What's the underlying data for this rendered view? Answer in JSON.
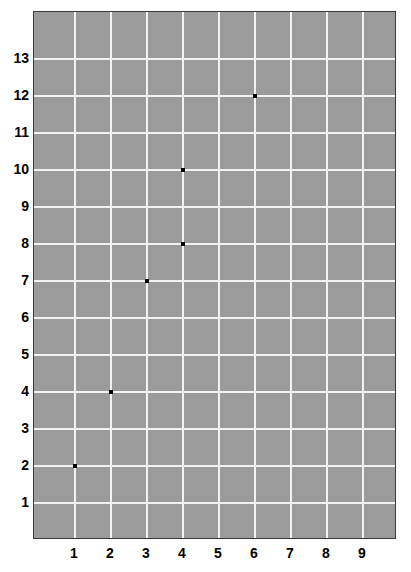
{
  "chart_data": {
    "type": "scatter",
    "title": "",
    "xlabel": "",
    "ylabel": "",
    "xlim": [
      0.0,
      10.0
    ],
    "ylim": [
      0.0,
      14.28
    ],
    "grid": true,
    "legend": null,
    "background_color": "#9b9b9b",
    "gridline_color": "#f2f2f2",
    "marker_color": "#000000",
    "axis_border_color": "#3a3a3a",
    "x_tick_labels": [
      "1",
      "2",
      "3",
      "4",
      "5",
      "6",
      "7",
      "8",
      "9"
    ],
    "x_tick_values": [
      1,
      2,
      3,
      4,
      5,
      6,
      7,
      8,
      9
    ],
    "y_tick_labels": [
      "1",
      "2",
      "3",
      "4",
      "5",
      "6",
      "7",
      "8",
      "9",
      "10",
      "11",
      "12",
      "13"
    ],
    "y_tick_values": [
      1,
      2,
      3,
      4,
      5,
      6,
      7,
      8,
      9,
      10,
      11,
      12,
      13
    ],
    "points": [
      {
        "x": 1,
        "y": 2
      },
      {
        "x": 2,
        "y": 4
      },
      {
        "x": 3,
        "y": 7
      },
      {
        "x": 4,
        "y": 8
      },
      {
        "x": 4,
        "y": 10
      },
      {
        "x": 6,
        "y": 12
      }
    ]
  },
  "plot": {
    "px": {
      "left": 33,
      "top": 11,
      "width": 363,
      "height": 528,
      "x_origin": 74,
      "x_step": 36,
      "y_origin": 502,
      "y_step": 37
    }
  }
}
